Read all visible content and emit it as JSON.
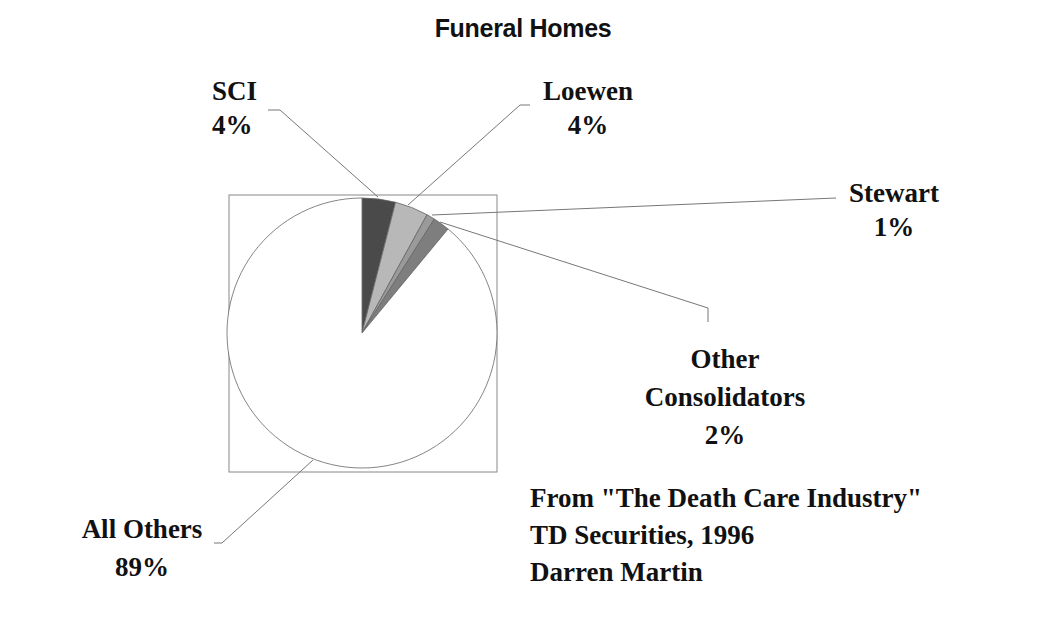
{
  "chart_data": {
    "type": "pie",
    "title": "Funeral Homes",
    "start_angle_deg": 0,
    "direction": "clockwise",
    "slices": [
      {
        "label": "SCI",
        "value": 4,
        "display": "4%",
        "color": "#4a4a4a"
      },
      {
        "label": "Loewen",
        "value": 4,
        "display": "4%",
        "color": "#b8b8b8"
      },
      {
        "label": "Stewart",
        "value": 1,
        "display": "1%",
        "color": "#9a9a9a"
      },
      {
        "label": "Other Consolidators",
        "value": 2,
        "display": "2%",
        "color": "#7e7e7e"
      },
      {
        "label": "All Others",
        "value": 89,
        "display": "89%",
        "color": "#ffffff"
      }
    ],
    "legend": "none (leader-line labels)",
    "source_note": [
      "From \"The Death Care Industry\"",
      "TD Securities, 1996",
      "Darren Martin"
    ]
  },
  "labels": {
    "sci": {
      "name": "SCI",
      "pct": "4%"
    },
    "loewen": {
      "name": "Loewen",
      "pct": "4%"
    },
    "stewart": {
      "name": "Stewart",
      "pct": "1%"
    },
    "other": {
      "name1": "Other",
      "name2": "Consolidators",
      "pct": "2%"
    },
    "all_others": {
      "name": "All Others",
      "pct": "89%"
    }
  },
  "source": {
    "line1": "From \"The Death Care Industry\"",
    "line2": "TD Securities, 1996",
    "line3": "Darren Martin"
  }
}
